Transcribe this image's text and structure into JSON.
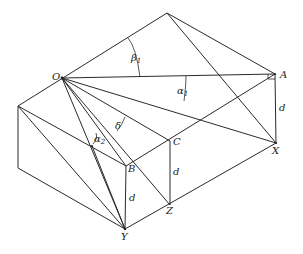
{
  "figure": {
    "type": "geometric-block-diagram",
    "vertices": {
      "T": [
        167,
        13
      ],
      "O": [
        62,
        78
      ],
      "A": [
        275,
        74
      ],
      "X": [
        276,
        143
      ],
      "L": [
        18,
        106
      ],
      "LB": [
        18,
        168
      ],
      "C": [
        170,
        141
      ],
      "Z": [
        170,
        205
      ],
      "B": [
        126,
        166
      ],
      "Y": [
        125,
        229
      ],
      "P": [
        92,
        146
      ]
    },
    "labels": {
      "O": "O",
      "A": "A",
      "X": "X",
      "B": "B",
      "C": "C",
      "Y": "Y",
      "Z": "Z",
      "d_right": "d",
      "d_middle": "d",
      "d_left": "d",
      "beta1": "β",
      "beta1_sub": "1",
      "alpha1": "α",
      "alpha1_sub": "1",
      "alpha2": "α",
      "alpha2_sub": "2",
      "delta": "δ"
    }
  }
}
